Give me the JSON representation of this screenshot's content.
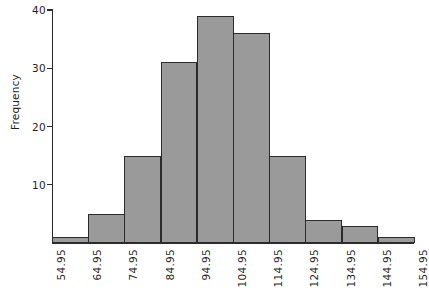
{
  "chart_data": {
    "type": "bar",
    "title": "",
    "subtitle": "",
    "xlabel": "",
    "ylabel": "Frequency",
    "orientation": "vertical",
    "grid": false,
    "legend": null,
    "bin_edges": [
      "54.95",
      "64.95",
      "74.95",
      "84.95",
      "94.95",
      "104.95",
      "114.95",
      "124.95",
      "134.95",
      "144.95",
      "154.95"
    ],
    "categories": [
      "54.95-64.95",
      "64.95-74.95",
      "74.95-84.95",
      "84.95-94.95",
      "94.95-104.95",
      "104.95-114.95",
      "114.95-124.95",
      "124.95-134.95",
      "134.95-144.95",
      "144.95-154.95"
    ],
    "values": [
      1,
      5,
      15,
      31,
      39,
      36,
      15,
      4,
      3,
      1
    ],
    "ylim": [
      0,
      40
    ],
    "yticks": [
      10,
      20,
      30,
      40
    ],
    "ytick_labels": [
      "10",
      "20",
      "30",
      "40"
    ],
    "xlim": [
      "54.95",
      "154.95"
    ],
    "bar_fill_color": "#9a9a9a",
    "bar_edge_color": "#2b2b2b",
    "axis_color": "#2b2b2b",
    "background_color": "#ffffff"
  },
  "axes": {
    "y_label": "Frequency"
  }
}
